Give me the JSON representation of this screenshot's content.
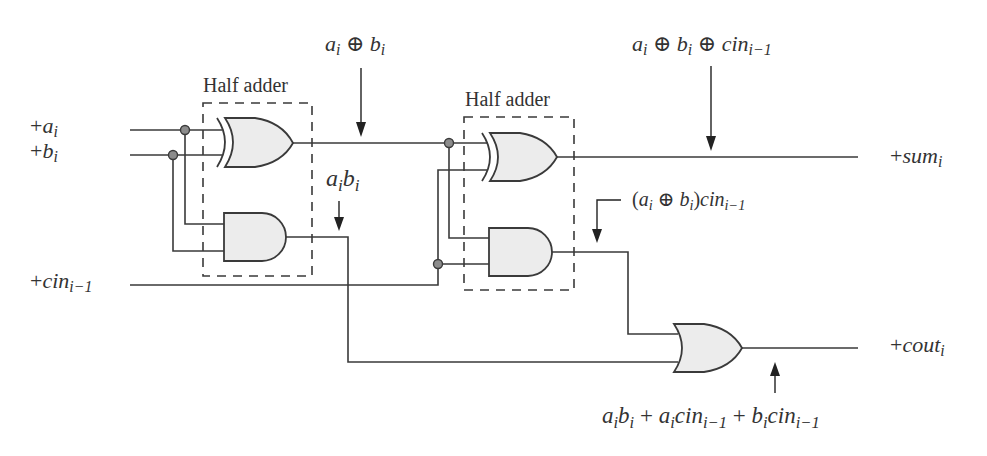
{
  "diagram": {
    "type": "logic-circuit",
    "colors": {
      "wire": "#3a3a3a",
      "gate_fill": "#ececec",
      "junction": "#8c8c8c",
      "background": "#ffffff"
    },
    "inputs": {
      "a": {
        "sign": "+",
        "base": "a",
        "sub": "i"
      },
      "b": {
        "sign": "+",
        "base": "b",
        "sub": "i"
      },
      "cin": {
        "sign": "+",
        "base": "cin",
        "sub": "i−1"
      }
    },
    "outputs": {
      "sum": {
        "sign": "+",
        "base": "sum",
        "sub": "i"
      },
      "cout": {
        "sign": "+",
        "base": "cout",
        "sub": "i"
      }
    },
    "blocks": [
      {
        "label": "Half adder",
        "gates": [
          "XOR",
          "AND"
        ]
      },
      {
        "label": "Half adder",
        "gates": [
          "XOR",
          "AND"
        ]
      }
    ],
    "final_gate": "OR",
    "annotations": {
      "xor1": {
        "a": "a",
        "a_sub": "i",
        "op": " ⊕ ",
        "b": "b",
        "b_sub": "i"
      },
      "and1": {
        "a": "a",
        "a_sub": "i",
        "b": "b",
        "b_sub": "i"
      },
      "sum": {
        "a": "a",
        "a_sub": "i",
        "op1": " ⊕ ",
        "b": "b",
        "b_sub": "i",
        "op2": " ⊕ ",
        "c": "cin",
        "c_sub": "i−1"
      },
      "and2": {
        "open": "(",
        "a": "a",
        "a_sub": "i",
        "op": " ⊕ ",
        "b": "b",
        "b_sub": "i",
        "close": ")",
        "c": "cin",
        "c_sub": "i−1"
      },
      "cout": {
        "t1a": "a",
        "t1a_sub": "i",
        "t1b": "b",
        "t1b_sub": "i",
        "plus1": " + ",
        "t2a": "a",
        "t2a_sub": "i",
        "t2b": "cin",
        "t2b_sub": "i−1",
        "plus2": " + ",
        "t3a": "b",
        "t3a_sub": "i",
        "t3b": "cin",
        "t3b_sub": "i−1"
      }
    }
  }
}
